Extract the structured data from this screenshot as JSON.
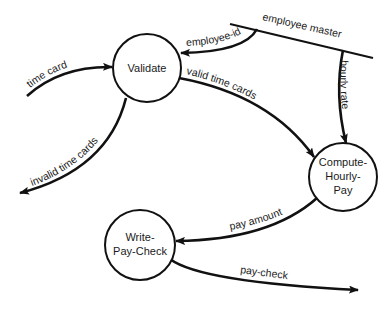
{
  "diagram": {
    "type": "data-flow-diagram",
    "processes": [
      {
        "id": "validate",
        "lines": [
          "Validate"
        ]
      },
      {
        "id": "compute",
        "lines": [
          "Compute-",
          "Hourly-",
          "Pay"
        ]
      },
      {
        "id": "write",
        "lines": [
          "Write-",
          "Pay-Check"
        ]
      }
    ],
    "stores": [
      {
        "id": "employee-master",
        "label": "employee master"
      }
    ],
    "flows": [
      {
        "id": "time-card",
        "label": "time card",
        "from": "external",
        "to": "validate"
      },
      {
        "id": "employee-id",
        "label": "employee-id",
        "from": "employee-master",
        "to": "validate"
      },
      {
        "id": "invalid-time-cards",
        "label": "invalid time cards",
        "from": "validate",
        "to": "external"
      },
      {
        "id": "valid-time-cards",
        "label": "valid time cards",
        "from": "validate",
        "to": "compute"
      },
      {
        "id": "hourly-rate",
        "label": "hourly rate",
        "from": "employee-master",
        "to": "compute"
      },
      {
        "id": "pay-amount",
        "label": "pay amount",
        "from": "compute",
        "to": "write"
      },
      {
        "id": "pay-check",
        "label": "pay-check",
        "from": "write",
        "to": "external"
      }
    ]
  }
}
